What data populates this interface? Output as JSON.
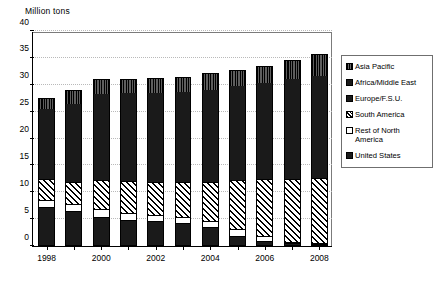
{
  "chart_data": {
    "type": "bar",
    "subtype": "stacked-vertical",
    "title": "Million tons",
    "xlabel": "",
    "ylabel": "Million tons",
    "ylim": [
      0,
      40
    ],
    "ytick_step": 5,
    "yticks": [
      "0",
      "5",
      "10",
      "15",
      "20",
      "25",
      "30",
      "35",
      "40"
    ],
    "grid": true,
    "grid_axis": "y",
    "legend_position": "right",
    "x": [
      "1998",
      "1999",
      "2000",
      "2001",
      "2002",
      "2003",
      "2004",
      "2005",
      "2006",
      "2007",
      "2008"
    ],
    "categories": [
      "1998",
      "1999",
      "2000",
      "2001",
      "2002",
      "2003",
      "2004",
      "2005",
      "2006",
      "2007",
      "2008"
    ],
    "xtick_labels_shown": [
      "1998",
      "",
      "2000",
      "",
      "2002",
      "",
      "2004",
      "",
      "2006",
      "",
      "2008"
    ],
    "series": [
      {
        "name": "United States",
        "pattern": "solid-black",
        "color": "#1a1a1a",
        "values": [
          7.0,
          6.3,
          5.2,
          4.6,
          4.4,
          4.1,
          3.3,
          1.7,
          0.7,
          0.3,
          0.2
        ]
      },
      {
        "name": "Rest of North America",
        "pattern": "white",
        "color": "#ffffff",
        "values": [
          1.5,
          1.5,
          1.6,
          1.6,
          1.4,
          1.3,
          1.3,
          1.4,
          1.1,
          0.5,
          0.4
        ]
      },
      {
        "name": "South America",
        "pattern": "diagonal-hatch",
        "color": "#ffffff",
        "values": [
          4.0,
          4.2,
          5.4,
          5.9,
          6.1,
          6.5,
          7.4,
          9.1,
          10.6,
          11.7,
          12.0
        ]
      },
      {
        "name": "Europe/F.S.U.",
        "pattern": "solid-black",
        "color": "#1a1a1a",
        "values": [
          6.6,
          7.0,
          7.1,
          7.0,
          7.1,
          7.0,
          7.1,
          7.2,
          7.3,
          7.4,
          7.5
        ]
      },
      {
        "name": "Africa/Middle East",
        "pattern": "solid-black",
        "color": "#1a1a1a",
        "values": [
          6.4,
          7.4,
          9.0,
          9.3,
          9.5,
          9.8,
          10.0,
          10.3,
          10.6,
          11.1,
          11.6
        ]
      },
      {
        "name": "Asia Pacific",
        "pattern": "vertical-stripe",
        "color": "#262626",
        "values": [
          2.0,
          2.7,
          2.8,
          2.7,
          2.7,
          2.8,
          3.0,
          3.1,
          3.1,
          3.6,
          4.0
        ]
      }
    ],
    "totals": [
      27.5,
      29.1,
      31.1,
      31.1,
      31.2,
      31.5,
      32.1,
      32.8,
      33.4,
      34.6,
      35.7
    ]
  },
  "legend": {
    "items": [
      {
        "label": "Asia Pacific",
        "pattern": "vstripe"
      },
      {
        "label": "Africa/Middle East",
        "pattern": "solid"
      },
      {
        "label": "Europe/F.S.U.",
        "pattern": "solid"
      },
      {
        "label": "South America",
        "pattern": "hatch"
      },
      {
        "label": "Rest of North\nAmerica",
        "pattern": "white"
      },
      {
        "label": "United States",
        "pattern": "solid"
      }
    ]
  }
}
